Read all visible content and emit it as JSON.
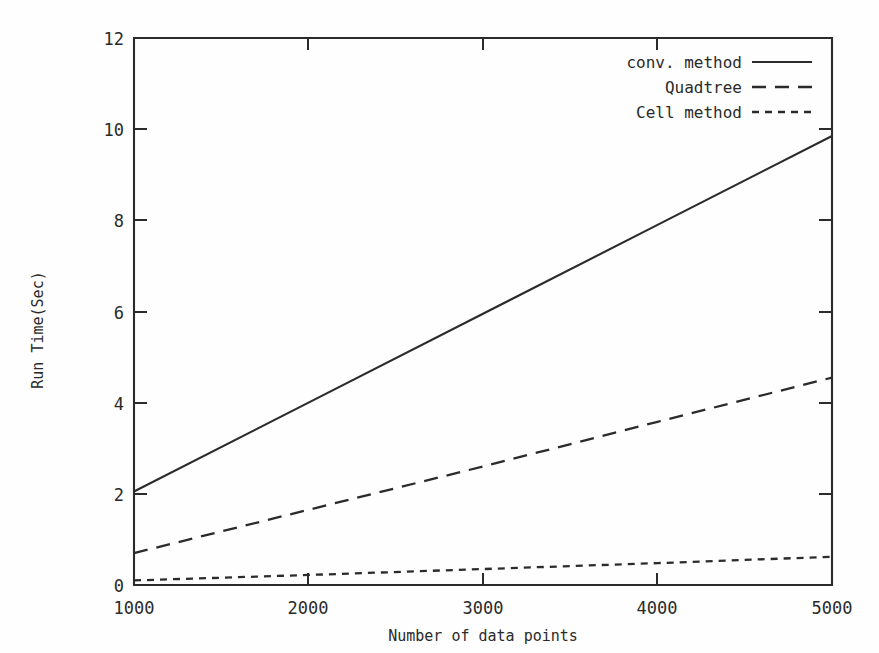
{
  "chart_data": {
    "type": "line",
    "title": "",
    "xlabel": "Number of data points",
    "ylabel": "Run Time(Sec)",
    "xlim": [
      1000,
      5000
    ],
    "ylim": [
      0,
      12
    ],
    "xticks": [
      1000,
      2000,
      3000,
      4000,
      5000
    ],
    "yticks": [
      0,
      2,
      4,
      6,
      8,
      10,
      12
    ],
    "xtick_labels": [
      "1000",
      "2000",
      "3000",
      "4000",
      "5000"
    ],
    "ytick_labels": [
      "0",
      "2",
      "4",
      "6",
      "8",
      "10",
      "12"
    ],
    "grid": false,
    "legend_position": "top-right",
    "x": [
      1000,
      2000,
      3000,
      4000,
      5000
    ],
    "series": [
      {
        "name": "conv. method",
        "style": "solid",
        "values": [
          2.05,
          4.0,
          5.95,
          7.9,
          9.85
        ]
      },
      {
        "name": "Quadtree",
        "style": "dashed",
        "values": [
          0.7,
          1.65,
          2.6,
          3.58,
          4.55
        ]
      },
      {
        "name": "Cell method",
        "style": "dotted",
        "values": [
          0.1,
          0.22,
          0.35,
          0.48,
          0.62
        ]
      }
    ]
  },
  "legend": {
    "items": [
      {
        "label": "conv. method",
        "style": "solid"
      },
      {
        "label": "Quadtree",
        "style": "dashed"
      },
      {
        "label": "Cell method",
        "style": "dotted"
      }
    ]
  },
  "axes": {
    "x_title": "Number of data points",
    "y_title": "Run Time(Sec)"
  },
  "colors": {
    "ink": "#2b2b2b",
    "background": "#fefefe"
  }
}
